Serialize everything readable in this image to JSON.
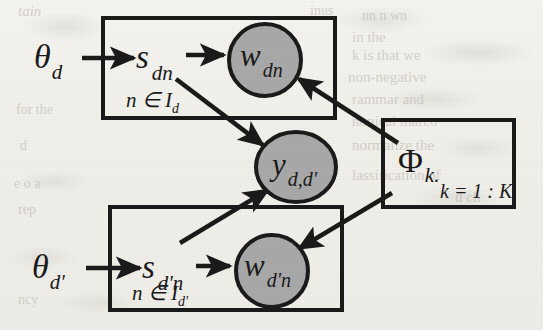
{
  "figure": {
    "type": "plate-notation-graphical-model",
    "background_color": "#f1efea",
    "ink_color": "#1a1a1a",
    "observed_node_fill": "#a8a8a8"
  },
  "nodes": {
    "theta_d": {
      "label": "θ",
      "sub": "d",
      "shape": "latent-text",
      "x": 48,
      "y": 58
    },
    "theta_dprime": {
      "label": "θ",
      "sub": "d'",
      "shape": "latent-text",
      "x": 48,
      "y": 268
    },
    "s_dn": {
      "label": "s",
      "sub": "dn",
      "shape": "latent-text",
      "x": 152,
      "y": 60
    },
    "s_dprime_n": {
      "label": "s",
      "sub": "d'n",
      "shape": "latent-text",
      "x": 157,
      "y": 270
    },
    "w_dn": {
      "label": "w",
      "sub": "dn",
      "shape": "observed-circle",
      "cx": 265,
      "cy": 60,
      "r": 37
    },
    "w_dprime_n": {
      "label": "w",
      "sub": "d'n",
      "shape": "observed-circle",
      "cx": 272,
      "cy": 271,
      "r": 37
    },
    "y_d_dprime": {
      "label": "y",
      "sub": "d,d'",
      "shape": "observed-circle",
      "cx": 296,
      "cy": 167,
      "rx": 40,
      "ry": 35
    },
    "phi_k": {
      "label": "Φ",
      "sub": "k.",
      "shape": "latent-text",
      "x": 420,
      "y": 160
    }
  },
  "plates": [
    {
      "name": "document-d-plate",
      "index_label": "n ∈ I",
      "index_sub": "d",
      "x": 103,
      "y": 18,
      "w": 232,
      "h": 100
    },
    {
      "name": "document-dprime-plate",
      "index_label": "n ∈ I",
      "index_sub": "d'",
      "x": 110,
      "y": 207,
      "w": 232,
      "h": 103
    },
    {
      "name": "topic-plate",
      "index_label": "k = 1 : K",
      "index_sub": "",
      "x": 383,
      "y": 120,
      "w": 131,
      "h": 87
    }
  ],
  "edges": [
    {
      "name": "theta_d-to-s_dn",
      "from": "theta_d",
      "to": "s_dn",
      "style": "straight-arrow"
    },
    {
      "name": "s_dn-to-w_dn",
      "from": "s_dn",
      "to": "w_dn",
      "style": "straight-arrow"
    },
    {
      "name": "s_dn-to-y",
      "from": "s_dn",
      "to": "y_d_dprime",
      "style": "diagonal-arrow"
    },
    {
      "name": "theta_dprime-to-s_dprime_n",
      "from": "theta_dprime",
      "to": "s_dprime_n",
      "style": "straight-arrow"
    },
    {
      "name": "s_dprime_n-to-w_dprime_n",
      "from": "s_dprime_n",
      "to": "w_dprime_n",
      "style": "straight-arrow"
    },
    {
      "name": "s_dprime_n-to-y",
      "from": "s_dprime_n",
      "to": "y_d_dprime",
      "style": "diagonal-arrow"
    },
    {
      "name": "phi-to-w_dn",
      "from": "phi_k",
      "to": "w_dn",
      "style": "diagonal-arrow"
    },
    {
      "name": "phi-to-w_dprime_n",
      "from": "phi_k",
      "to": "w_dprime_n",
      "style": "diagonal-arrow"
    }
  ],
  "labels": {
    "theta_d": "θ",
    "theta_d_sub": "d",
    "theta_dprime": "θ",
    "theta_dprime_sub": "d'",
    "s_dn": "s",
    "s_dn_sub": "dn",
    "s_dprime_n": "s",
    "s_dprime_n_sub": "d'n",
    "w_dn": "w",
    "w_dn_sub": "dn",
    "w_dprime_n": "w",
    "w_dprime_n_sub": "d'n",
    "y": "y",
    "y_sub": "d,d'",
    "phi": "Φ",
    "phi_sub": "k.",
    "plate_d_index": "n ∈ I",
    "plate_d_index_sub": "d",
    "plate_dprime_index": "n ∈ I",
    "plate_dprime_index_sub": "d'",
    "plate_k_index": "k = 1 : K"
  },
  "background_ghost_text": [
    {
      "text": "inus",
      "x": 310,
      "y": 14
    },
    {
      "text": "nn  n wn",
      "x": 362,
      "y": 18
    },
    {
      "text": "in the",
      "x": 352,
      "y": 40
    },
    {
      "text": "k is that we",
      "x": 352,
      "y": 58
    },
    {
      "text": "non-negative",
      "x": 348,
      "y": 80
    },
    {
      "text": "we allow",
      "x": 448,
      "y": 80
    },
    {
      "text": "rammar  and",
      "x": 352,
      "y": 103
    },
    {
      "text": "we use",
      "x": 468,
      "y": 103
    },
    {
      "text": "nonical marco",
      "x": 352,
      "y": 125
    },
    {
      "text": "normalize the",
      "x": 352,
      "y": 148
    },
    {
      "text": "Then we",
      "x": 472,
      "y": 148
    },
    {
      "text": "lassification of",
      "x": 352,
      "y": 178
    },
    {
      "text": "d  ch",
      "x": 462,
      "y": 200
    },
    {
      "text": "tain",
      "x": 18,
      "y": 16
    },
    {
      "text": "for  the",
      "x": 18,
      "y": 112
    },
    {
      "text": "d",
      "x": 22,
      "y": 148
    },
    {
      "text": "e  o a",
      "x": 18,
      "y": 186
    },
    {
      "text": "rep",
      "x": 22,
      "y": 212
    },
    {
      "text": "ncy",
      "x": 22,
      "y": 302
    }
  ]
}
